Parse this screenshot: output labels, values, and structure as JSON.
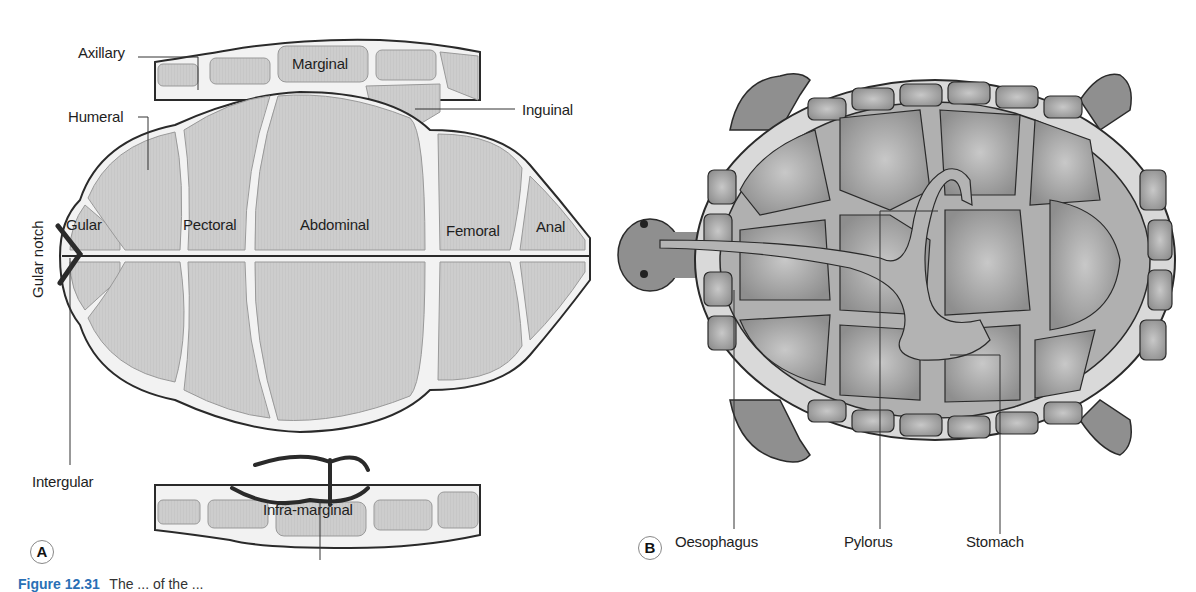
{
  "figure": {
    "caption_number": "Figure 12.31",
    "caption_text": "The ... of the ..."
  },
  "panel_a": {
    "letter": "A",
    "subject": "plastron-scutes",
    "labels": {
      "axillary": "Axillary",
      "marginal": "Marginal",
      "inguinal": "Inguinal",
      "humeral": "Humeral",
      "gular": "Gular",
      "gular_notch": "Gular notch",
      "pectoral": "Pectoral",
      "abdominal": "Abdominal",
      "femoral": "Femoral",
      "anal": "Anal",
      "intergular": "Intergular",
      "infra_marginal": "Infra-marginal"
    }
  },
  "panel_b": {
    "letter": "B",
    "subject": "turtle-digestive-tract",
    "labels": {
      "oesophagus": "Oesophagus",
      "pylorus": "Pylorus",
      "stomach": "Stomach"
    }
  },
  "colors": {
    "scute_fill": "#cfcfcf",
    "seam": "#f2f2f2",
    "outline": "#2a2a2a",
    "body_fill": "#8f8f8f",
    "carapace_fill": "#9d9d9d",
    "gut_fill": "#b3b3b3",
    "caption_blue": "#2a6fb5"
  }
}
